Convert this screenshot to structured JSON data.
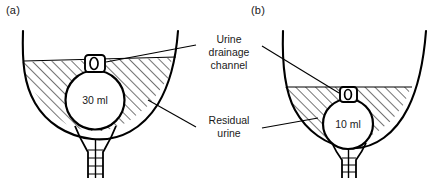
{
  "figure": {
    "background_color": "#ffffff",
    "ink_color": "#000000"
  },
  "panels": [
    {
      "id": "a",
      "label": "(a)",
      "balloon_volume_label": "30 ml",
      "balloon_volume_ml": 30,
      "description": "Large 30 ml balloon holds catheter drainage eye high above the bladder base, leaving a deep pool of residual urine"
    },
    {
      "id": "b",
      "label": "(b)",
      "balloon_volume_label": "10 ml",
      "balloon_volume_ml": 10,
      "description": "Smaller 10 ml balloon sits lower, so the drainage eye is nearer the bladder base and less residual urine remains"
    }
  ],
  "callouts": [
    {
      "id": "urine-drainage-channel",
      "text": "Urine\ndrainage\nchannel",
      "lines": [
        "Urine",
        "drainage",
        "channel"
      ]
    },
    {
      "id": "residual-urine",
      "text": "Residual\nurine",
      "lines": [
        "Residual",
        "urine"
      ]
    }
  ],
  "elements": {
    "bladder_wall": "bladder-wall-outline",
    "residual_urine_fill": "diagonal-hatching",
    "balloon": "inflated-catheter-balloon",
    "drainage_eye": "catheter-drainage-eye",
    "catheter_shaft": "dual-lumen-catheter-shaft"
  }
}
